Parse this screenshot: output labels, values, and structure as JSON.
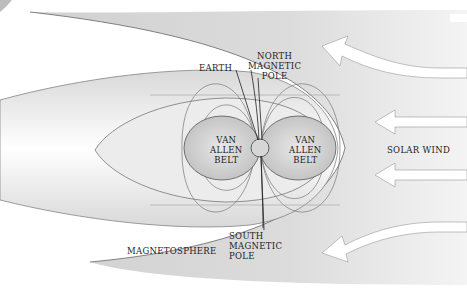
{
  "diagram": {
    "labels": {
      "earth": "EARTH",
      "north_pole": "NORTH\nMAGNETIC\nPOLE",
      "south_pole": "SOUTH\nMAGNETIC\nPOLE",
      "van_allen_left": "VAN\nALLEN\nBELT",
      "van_allen_right": "VAN\nALLEN\nBELT",
      "solar_wind": "SOLAR WIND",
      "magnetosphere": "MAGNETOSPHERE"
    },
    "colors": {
      "background": "#ffffff",
      "solar_wind_region": "#c8c8c8",
      "field_region": "#e6e6e6",
      "belt": "#cfcfcf",
      "outline": "#555555",
      "arrow": "#ffffff"
    },
    "arrows": {
      "count": 5,
      "direction": "left",
      "curved_outer": 2,
      "straight": 3
    }
  }
}
